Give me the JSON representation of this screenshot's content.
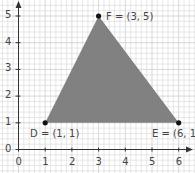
{
  "diagram": {
    "type": "coordinate-grid-triangle",
    "axes": {
      "x_ticks": [
        "0",
        "1",
        "2",
        "3",
        "4",
        "5",
        "6"
      ],
      "y_ticks": [
        "0",
        "1",
        "2",
        "3",
        "4",
        "5"
      ]
    },
    "points": [
      {
        "name": "D",
        "x": 1,
        "y": 1,
        "label": "D = (1, 1)"
      },
      {
        "name": "E",
        "x": 6,
        "y": 1,
        "label": "E = (6, 1)"
      },
      {
        "name": "F",
        "x": 3,
        "y": 5,
        "label": "F = (3, 5)"
      }
    ],
    "colors": {
      "fill": "#7a7a7a",
      "grid_minor": "#d6d6d6",
      "grid_major": "#bdbdbd",
      "axis": "#333333",
      "point": "#111111"
    }
  }
}
